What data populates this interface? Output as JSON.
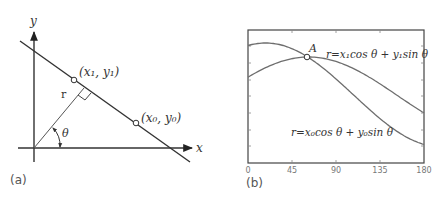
{
  "panel_a": {
    "label": "(a)",
    "axis_x": "x",
    "axis_y": "y",
    "r_label": "r",
    "theta_label": "θ",
    "point1_label": "(x₁, y₁)",
    "point0_label": "(x₀, y₀)"
  },
  "panel_b": {
    "label": "(b)",
    "intersection_label": "A",
    "curve1_label": "r=x₁cos θ + y₁sin θ",
    "curve0_label": "r=x₀cos θ + y₀sin θ",
    "x_ticks": [
      "0",
      "45",
      "90",
      "135",
      "180"
    ]
  },
  "colors": {
    "axis": "#333333",
    "line": "#3a3a3a",
    "curve": "#6e6e6e",
    "frame": "#444444"
  },
  "chart_data": {
    "type": "line",
    "title": "",
    "xlabel": "θ (degrees)",
    "ylabel": "r",
    "x": [
      0,
      45,
      90,
      135,
      180
    ],
    "xlim": [
      0,
      180
    ],
    "grid": false,
    "series": [
      {
        "name": "r=x₁cos θ + y₁sin θ",
        "peak_theta": 18,
        "values_relative": [
          0.95,
          0.89,
          0.31,
          -0.45,
          -0.95
        ]
      },
      {
        "name": "r=x₀cos θ + y₀sin θ",
        "peak_theta": 62,
        "values_relative": [
          0.47,
          0.96,
          0.88,
          0.31,
          -0.47
        ]
      }
    ],
    "annotations": [
      {
        "label": "A",
        "theta": 60,
        "note": "intersection of the two sinusoids"
      }
    ]
  }
}
